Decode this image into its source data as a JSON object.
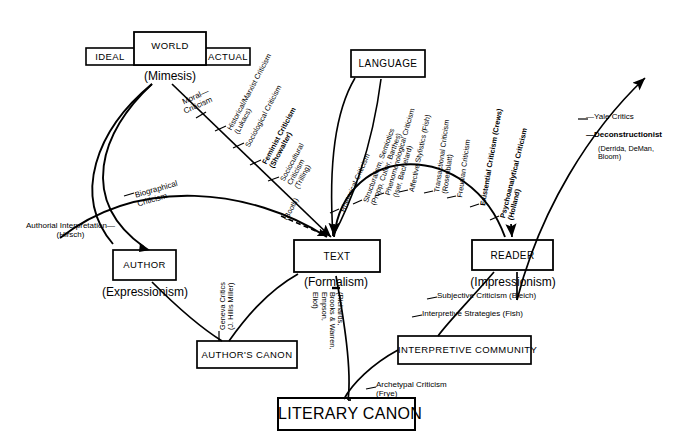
{
  "diagram": {
    "boxes": {
      "world": "WORLD",
      "ideal": "IDEAL",
      "actual": "ACTUAL",
      "language": "LANGUAGE",
      "author": "AUTHOR",
      "text": "TEXT",
      "reader": "READER",
      "authors_canon": "AUTHOR'S CANON",
      "interpretive_community": "INTERPRETIVE COMMUNITY",
      "literary_canon": "LITERARY CANON"
    },
    "modes": {
      "mimesis": "(Mimesis)",
      "expressionism": "(Expressionism)",
      "formalism": "(Formalism)",
      "impressionism": "(Impressionism)"
    },
    "world_branch": [
      {
        "id": "moral-criticism",
        "label": "Moral—\nCriticism"
      },
      {
        "id": "historical-marxist-criticism",
        "label": "Historical/Marxist Criticism\n(Lukacs)"
      },
      {
        "id": "sociological-criticism",
        "label": "Sociological Criticism"
      },
      {
        "id": "feminist-criticism",
        "label": "Feminist Criticism\n(Showalter)",
        "bold": true
      },
      {
        "id": "sociocultural-criticism",
        "label": "Sociocultural\nCriticism\n(Trilling)"
      },
      {
        "id": "biographical-criticism",
        "label": "Biographical\nCriticism"
      },
      {
        "id": "authorial-interpretation",
        "label": "Authorial Interpretation—\n(Hirsch)"
      }
    ],
    "language_branch": [
      {
        "id": "booth",
        "label": "(Booth)"
      },
      {
        "id": "rhetorical-criticism",
        "label": "Rhetorical Criticism"
      },
      {
        "id": "structuralism-semiotics",
        "label": "Structuralism, Semiotics\n(Propp, Culler, Barthes)"
      },
      {
        "id": "phenomenological-criticism",
        "label": "Phenomenological Criticism\n(Iser, Bachelard)"
      },
      {
        "id": "affective-stylistics",
        "label": "Affective Stylistics (Fish)"
      },
      {
        "id": "transactional-criticism",
        "label": "Transactional Criticism\n(Rosenblatt)"
      },
      {
        "id": "freudian-criticism",
        "label": "Freudian Criticism"
      },
      {
        "id": "existential-criticism",
        "label": "Existential Criticism (Crews)",
        "bold": true
      },
      {
        "id": "psychoanalytical-criticism",
        "label": "Psychoanalytical Criticism\n(Holland)",
        "bold": true
      }
    ],
    "right_branch": [
      {
        "id": "yale-critics",
        "label": "—Yale Critics"
      },
      {
        "id": "deconstructionist",
        "label": "—Deconstructionist",
        "bold": true
      },
      {
        "id": "deconstructionist-names",
        "label": "(Derrida, DeMan,\nBloom)"
      }
    ],
    "lower_labels": [
      {
        "id": "geneva-critics",
        "label": "Geneva Critics\n(J. Hillis Miller)"
      },
      {
        "id": "new-criticism-names",
        "label": "(Richards,\nBrooks & Warren,\nEmpson,\nEliot)"
      },
      {
        "id": "subjective-criticism",
        "label": "Subjective Criticism (Bleich)"
      },
      {
        "id": "interpretive-strategies",
        "label": "Interpretive Strategies (Fish)"
      },
      {
        "id": "archetypal-criticism",
        "label": "Archetypal Criticism\n(Frye)"
      }
    ],
    "colors": {
      "ink": "#000000",
      "paper": "#ffffff"
    }
  }
}
